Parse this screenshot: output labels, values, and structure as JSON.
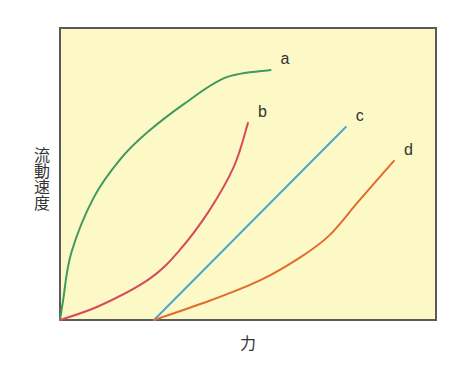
{
  "chart_data": {
    "type": "line",
    "title": "",
    "xlabel": "力",
    "ylabel": "流動速度",
    "xlim": [
      0,
      100
    ],
    "ylim": [
      0,
      100
    ],
    "grid": false,
    "legend": "inline labels at line ends",
    "ticks": "none",
    "background": "#fdf9c6",
    "frame_color": "#5a5a5a",
    "series": [
      {
        "name": "a",
        "color": "#3f9a5e",
        "points": [
          [
            0,
            0
          ],
          [
            0.8,
            6.5
          ],
          [
            3,
            23
          ],
          [
            9,
            42
          ],
          [
            16,
            55
          ],
          [
            23,
            64
          ],
          [
            33,
            74
          ],
          [
            44,
            83
          ],
          [
            56,
            85.6
          ]
        ],
        "x": [
          0,
          0.8,
          3,
          9,
          16,
          23,
          33,
          44,
          30
        ],
        "note": "concave-down, rises steeply from origin"
      },
      {
        "name": "b",
        "color": "#d84a5b",
        "points": [
          [
            0,
            0
          ],
          [
            10.4,
            4.8
          ],
          [
            23.7,
            14
          ],
          [
            31.6,
            23.6
          ],
          [
            39.6,
            37.3
          ],
          [
            46.3,
            52.7
          ],
          [
            50,
            67.5
          ]
        ]
      },
      {
        "name": "c",
        "color": "#4ba6d4",
        "points": [
          [
            25,
            0
          ],
          [
            76,
            66.1
          ]
        ]
      },
      {
        "name": "d",
        "color": "#e06d2c",
        "points": [
          [
            25,
            0
          ],
          [
            39.6,
            6.5
          ],
          [
            52.9,
            13.4
          ],
          [
            63.6,
            21.2
          ],
          [
            71.5,
            28.8
          ],
          [
            79.5,
            40.8
          ],
          [
            88.8,
            54.5
          ]
        ]
      }
    ],
    "plot_box_px": {
      "left": 60,
      "top": 28,
      "right": 436,
      "bottom": 320
    }
  },
  "labels": {
    "y_axis": "流動速度",
    "x_axis": "力",
    "series": [
      "a",
      "b",
      "c",
      "d"
    ]
  }
}
